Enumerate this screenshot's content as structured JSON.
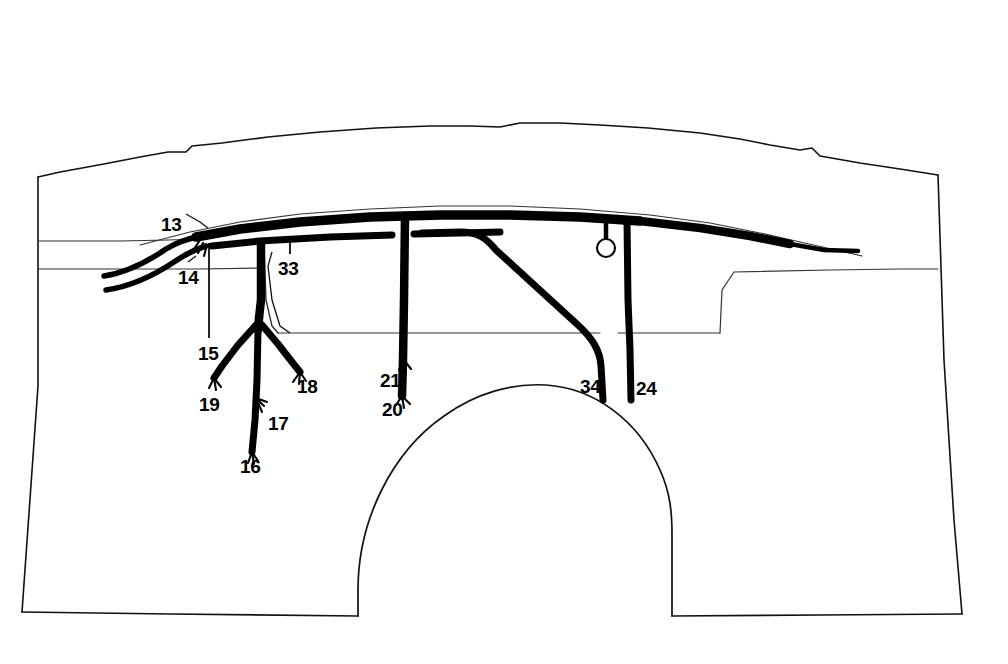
{
  "figure": {
    "kind": "patent-line-drawing",
    "background_color": "#ffffff",
    "ink_color": "#000000",
    "caption": ""
  },
  "labels": [
    {
      "id": "13",
      "text": "13",
      "x": 161,
      "y": 215,
      "target": "harness-entry-junction"
    },
    {
      "id": "14",
      "text": "14",
      "x": 178,
      "y": 268,
      "target": "lower-entry-cable"
    },
    {
      "id": "15",
      "text": "15",
      "x": 198,
      "y": 344,
      "target": "front-pillar-leader"
    },
    {
      "id": "16",
      "text": "16",
      "x": 240,
      "y": 457,
      "target": "trunk-lower-end"
    },
    {
      "id": "17",
      "text": "17",
      "x": 268,
      "y": 414,
      "target": "trunk-lower-tap"
    },
    {
      "id": "18",
      "text": "18",
      "x": 297,
      "y": 377,
      "target": "right-branch-end"
    },
    {
      "id": "19",
      "text": "19",
      "x": 199,
      "y": 395,
      "target": "left-branch-end"
    },
    {
      "id": "20",
      "text": "20",
      "x": 382,
      "y": 400,
      "target": "center-pillar-lower-end"
    },
    {
      "id": "21",
      "text": "21",
      "x": 380,
      "y": 371,
      "target": "center-pillar-tap"
    },
    {
      "id": "24",
      "text": "24",
      "x": 636,
      "y": 379,
      "target": "rear-drop-line"
    },
    {
      "id": "33",
      "text": "33",
      "x": 278,
      "y": 259,
      "target": "upper-window-branch"
    },
    {
      "id": "34",
      "text": "34",
      "x": 580,
      "y": 377,
      "target": "diagonal-branch-drop"
    }
  ],
  "harness": {
    "entry_cables": 2,
    "main_trunk": "roof rail running left to right, tapering at rear",
    "pillar_drops": [
      "front pillar 15",
      "center pillar 21/20",
      "diagonal 34",
      "rear drop 24"
    ],
    "branch_ends": [
      "16",
      "17",
      "18",
      "19",
      "20",
      "21"
    ],
    "connector_rings": 1
  },
  "body": {
    "features": [
      "roof contour",
      "beltline",
      "cowl line",
      "window frame",
      "wheel arch",
      "rocker panel"
    ]
  }
}
